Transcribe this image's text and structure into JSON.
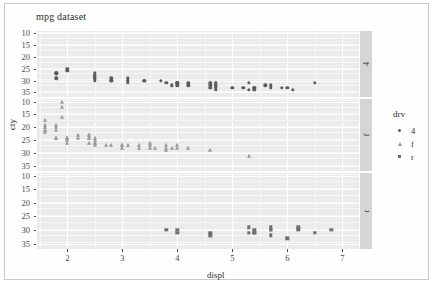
{
  "title": "mpg dataset",
  "axes": {
    "xlabel": "displ",
    "ylabel": "cty",
    "xticks": [
      "2",
      "3",
      "4",
      "5",
      "6",
      "7"
    ],
    "yticks": [
      "35",
      "30",
      "25",
      "20",
      "15",
      "10"
    ]
  },
  "legend": {
    "title": "drv",
    "items": [
      {
        "label": "4",
        "shape": "circle-icon",
        "color": "#5b5b5b"
      },
      {
        "label": "f",
        "shape": "triangle-icon",
        "color": "#9a9a9a"
      },
      {
        "label": "r",
        "shape": "square-icon",
        "color": "#6d6d6d"
      }
    ]
  },
  "facets": [
    {
      "label": "4"
    },
    {
      "label": "f"
    },
    {
      "label": "r"
    }
  ],
  "chart_data": {
    "type": "scatter",
    "title": "mpg dataset",
    "xlabel": "displ",
    "ylabel": "cty",
    "xlim": [
      1.45,
      7.3
    ],
    "ylim": [
      8,
      36
    ],
    "xticks": [
      2,
      3,
      4,
      5,
      6,
      7
    ],
    "yticks": [
      10,
      15,
      20,
      25,
      30,
      35
    ],
    "grid": true,
    "legend_position": "right",
    "facet_by": "drv",
    "facet_direction": "rows",
    "series": [
      {
        "name": "4",
        "facet": "4",
        "marker": "circle",
        "color": "#5b5b5b",
        "points": [
          [
            1.8,
            18
          ],
          [
            1.8,
            18
          ],
          [
            1.8,
            16
          ],
          [
            2.0,
            20
          ],
          [
            2.0,
            19
          ],
          [
            2.5,
            18
          ],
          [
            2.5,
            17
          ],
          [
            2.5,
            16
          ],
          [
            2.5,
            16
          ],
          [
            2.5,
            17
          ],
          [
            2.5,
            17
          ],
          [
            2.5,
            15
          ],
          [
            2.8,
            15
          ],
          [
            2.8,
            16
          ],
          [
            2.8,
            15
          ],
          [
            3.1,
            15
          ],
          [
            3.1,
            16
          ],
          [
            3.1,
            15
          ],
          [
            3.1,
            14
          ],
          [
            3.4,
            15
          ],
          [
            3.4,
            15
          ],
          [
            3.7,
            15
          ],
          [
            3.8,
            14
          ],
          [
            3.9,
            13
          ],
          [
            4.0,
            14
          ],
          [
            4.0,
            13
          ],
          [
            4.0,
            14
          ],
          [
            4.0,
            14
          ],
          [
            4.2,
            13
          ],
          [
            4.2,
            14
          ],
          [
            4.6,
            13
          ],
          [
            4.6,
            12
          ],
          [
            4.6,
            14
          ],
          [
            4.7,
            14
          ],
          [
            4.7,
            13
          ],
          [
            4.7,
            12
          ],
          [
            4.7,
            13
          ],
          [
            4.7,
            12
          ],
          [
            4.7,
            11
          ],
          [
            4.7,
            14
          ],
          [
            5.0,
            12
          ],
          [
            5.2,
            12
          ],
          [
            5.3,
            14
          ],
          [
            5.3,
            11
          ],
          [
            5.4,
            12
          ],
          [
            5.4,
            11
          ],
          [
            5.4,
            12
          ],
          [
            5.6,
            13
          ],
          [
            5.7,
            13
          ],
          [
            5.7,
            12
          ],
          [
            5.9,
            12
          ],
          [
            6.0,
            12
          ],
          [
            6.1,
            11
          ],
          [
            6.5,
            14
          ]
        ]
      },
      {
        "name": "f",
        "facet": "f",
        "marker": "triangle",
        "color": "#9a9a9a",
        "points": [
          [
            1.6,
            28
          ],
          [
            1.6,
            24
          ],
          [
            1.6,
            25
          ],
          [
            1.6,
            23
          ],
          [
            1.6,
            24
          ],
          [
            1.6,
            26
          ],
          [
            1.8,
            26
          ],
          [
            1.8,
            25
          ],
          [
            1.8,
            24
          ],
          [
            1.8,
            21
          ],
          [
            1.8,
            21
          ],
          [
            1.8,
            21
          ],
          [
            1.9,
            33
          ],
          [
            1.9,
            35
          ],
          [
            1.9,
            29
          ],
          [
            2.0,
            21
          ],
          [
            2.0,
            19
          ],
          [
            2.0,
            20
          ],
          [
            2.0,
            21
          ],
          [
            2.0,
            21
          ],
          [
            2.2,
            21
          ],
          [
            2.2,
            22
          ],
          [
            2.4,
            21
          ],
          [
            2.4,
            19
          ],
          [
            2.4,
            22
          ],
          [
            2.4,
            21
          ],
          [
            2.4,
            22
          ],
          [
            2.5,
            21
          ],
          [
            2.5,
            19
          ],
          [
            2.5,
            20
          ],
          [
            2.5,
            19
          ],
          [
            2.5,
            18
          ],
          [
            2.7,
            18
          ],
          [
            2.8,
            18
          ],
          [
            3.0,
            18
          ],
          [
            3.0,
            17
          ],
          [
            3.0,
            18
          ],
          [
            3.1,
            18
          ],
          [
            3.3,
            17
          ],
          [
            3.3,
            18
          ],
          [
            3.5,
            18
          ],
          [
            3.5,
            19
          ],
          [
            3.5,
            17
          ],
          [
            3.6,
            17
          ],
          [
            3.8,
            18
          ],
          [
            3.8,
            17
          ],
          [
            3.8,
            16
          ],
          [
            3.9,
            17
          ],
          [
            4.0,
            18
          ],
          [
            4.0,
            17
          ],
          [
            4.2,
            17
          ],
          [
            4.6,
            16
          ],
          [
            5.3,
            14
          ]
        ]
      },
      {
        "name": "r",
        "facet": "r",
        "marker": "square",
        "color": "#6d6d6d",
        "points": [
          [
            3.8,
            15
          ],
          [
            4.0,
            14
          ],
          [
            4.0,
            15
          ],
          [
            4.6,
            14
          ],
          [
            4.6,
            13
          ],
          [
            5.3,
            16
          ],
          [
            5.3,
            14
          ],
          [
            5.4,
            15
          ],
          [
            5.4,
            14
          ],
          [
            5.4,
            14
          ],
          [
            5.7,
            15
          ],
          [
            5.7,
            16
          ],
          [
            5.7,
            15
          ],
          [
            5.7,
            13
          ],
          [
            6.0,
            12
          ],
          [
            6.2,
            15
          ],
          [
            6.2,
            16
          ],
          [
            6.5,
            14
          ],
          [
            6.8,
            15
          ]
        ]
      }
    ]
  }
}
